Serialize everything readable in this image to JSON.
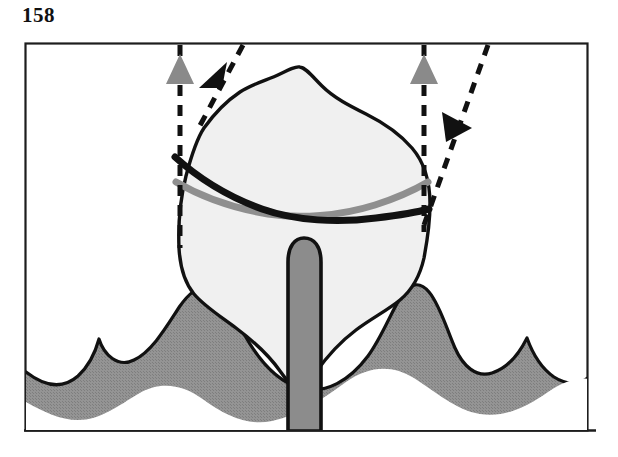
{
  "page": {
    "number": "158",
    "background_color": "#ffffff"
  },
  "figure": {
    "name": "tooth-eruption-diagram",
    "caption": "",
    "frame": {
      "stroke_color": "#1a1a1a",
      "x": 25,
      "y": 43,
      "width": 563,
      "height": 388
    },
    "colors": {
      "outline": "#111111",
      "crown_fill": "#f0f0f0",
      "gum_fill": "#8f8f8f",
      "root_fill": "#8c8c8c",
      "gray_marker": "#8a8a8a",
      "black_marker": "#111111",
      "gray_curve": "#8f8f8f"
    },
    "parts": [
      {
        "id": "tooth-crown",
        "label": "tooth crown",
        "fill": "#f0f0f0"
      },
      {
        "id": "tooth-root",
        "label": "tooth root",
        "fill": "#8c8c8c"
      },
      {
        "id": "gingiva",
        "label": "gingiva",
        "fill": "#8f8f8f"
      },
      {
        "id": "black-curve",
        "label": "black reference curve",
        "color": "#111111"
      },
      {
        "id": "gray-curve",
        "label": "gray reference curve",
        "color": "#8f8f8f"
      }
    ],
    "arrows": [
      {
        "id": "arrow-gray-left",
        "label": "left vertical eruption arrow",
        "color": "#8a8a8a",
        "direction": "up",
        "line_style": "dashed"
      },
      {
        "id": "arrow-black-left",
        "label": "left oblique arrow",
        "color": "#111111",
        "direction": "down-left",
        "line_style": "dashed"
      },
      {
        "id": "arrow-gray-right",
        "label": "right vertical eruption arrow",
        "color": "#8a8a8a",
        "direction": "up",
        "line_style": "dashed"
      },
      {
        "id": "arrow-black-right",
        "label": "right oblique arrow",
        "color": "#111111",
        "direction": "down-right",
        "line_style": "dashed"
      }
    ]
  }
}
